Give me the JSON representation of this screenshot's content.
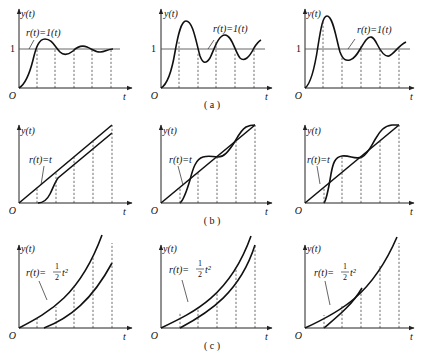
{
  "figure": {
    "rows": [
      {
        "caption": "( a )",
        "input_label": "r(t)=1(t)",
        "input_type": "unit step",
        "panels": [
          {
            "id": "a1",
            "y_label": "y(t)",
            "x_label": "t",
            "origin_label": "O",
            "level_label": "1",
            "description": "step response, small overshoot, damped oscillation"
          },
          {
            "id": "a2",
            "y_label": "y(t)",
            "x_label": "t",
            "origin_label": "O",
            "level_label": "1",
            "description": "step response, large overshoot, sustained-like oscillation"
          },
          {
            "id": "a3",
            "y_label": "y(t)",
            "x_label": "t",
            "origin_label": "O",
            "level_label": "1",
            "description": "step response, larger overshoot, oscillation"
          }
        ]
      },
      {
        "caption": "( b )",
        "input_label": "r(t)=t",
        "input_type": "unit ramp",
        "panels": [
          {
            "id": "b1",
            "y_label": "y(t)",
            "x_label": "t",
            "origin_label": "O",
            "description": "ramp response lagging with constant offset"
          },
          {
            "id": "b2",
            "y_label": "y(t)",
            "x_label": "t",
            "origin_label": "O",
            "description": "ramp response oscillating about r(t)=t"
          },
          {
            "id": "b3",
            "y_label": "y(t)",
            "x_label": "t",
            "origin_label": "O",
            "description": "ramp response larger oscillation about r(t)=t"
          }
        ]
      },
      {
        "caption": "( c )",
        "input_label_prefix": "r(t)=",
        "input_label_frac_num": "1",
        "input_label_frac_den": "2",
        "input_label_suffix": "t²",
        "input_type": "unit acceleration",
        "panels": [
          {
            "id": "c1",
            "y_label": "y(t)",
            "x_label": "t",
            "origin_label": "O",
            "description": "response lags with growing error"
          },
          {
            "id": "c2",
            "y_label": "y(t)",
            "x_label": "t",
            "origin_label": "O",
            "description": "response lags with roughly constant error"
          },
          {
            "id": "c3",
            "y_label": "y(t)",
            "x_label": "t",
            "origin_label": "O",
            "description": "response converges to r(t)"
          }
        ]
      }
    ]
  }
}
